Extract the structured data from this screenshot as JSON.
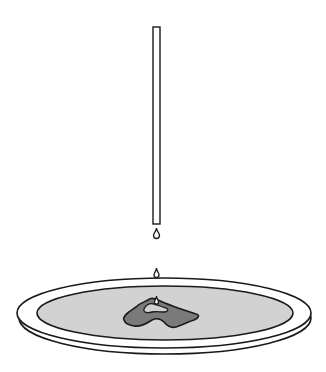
{
  "diagram": {
    "colors": {
      "background": "#ffffff",
      "outline": "#1a1a1a",
      "liquid": "#d2d2d2",
      "stain": "#7a7a7a",
      "tube_fill": "#ffffff"
    },
    "components": [
      {
        "id": "pipette",
        "label": ""
      },
      {
        "id": "falling-droplet",
        "label": ""
      },
      {
        "id": "droplet-on-rim",
        "label": ""
      },
      {
        "id": "dish",
        "label": ""
      },
      {
        "id": "liquid-pool",
        "label": ""
      },
      {
        "id": "stain",
        "label": ""
      }
    ]
  }
}
